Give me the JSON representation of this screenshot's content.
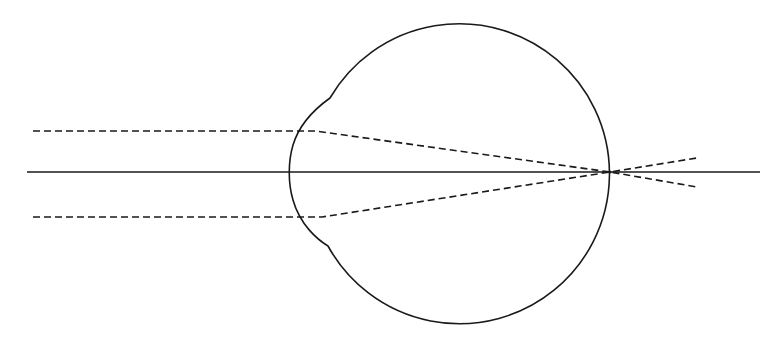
{
  "figure": {
    "colors": {
      "stroke": "#1a1a1a",
      "background": "#ffffff"
    },
    "geometry": {
      "optical_axis": {
        "x1": 27,
        "y1": 172,
        "x2": 760,
        "y2": 172
      },
      "eyeball_center": [
        460,
        172
      ],
      "eyeball_radius": 150,
      "cornea_apex": [
        290,
        172
      ],
      "focal_point": [
        610,
        172
      ]
    },
    "elements": [
      {
        "name": "optical-axis",
        "style": "solid"
      },
      {
        "name": "eyeball-outline",
        "style": "solid"
      },
      {
        "name": "cornea-bulge",
        "style": "solid"
      },
      {
        "name": "upper-incident-ray",
        "style": "dashed"
      },
      {
        "name": "lower-incident-ray",
        "style": "dashed"
      }
    ]
  }
}
